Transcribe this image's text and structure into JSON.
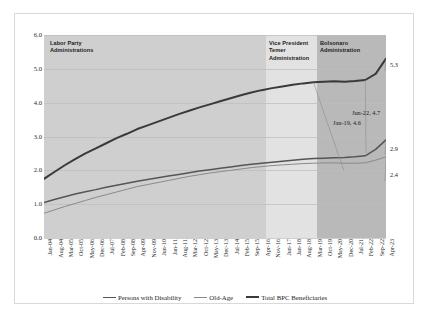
{
  "chart_data": {
    "type": "line",
    "title": "",
    "xlabel": "",
    "ylabel": "",
    "ylim": [
      0.0,
      6.0
    ],
    "ytick_labels": [
      "0.0",
      "1.0",
      "2.0",
      "3.0",
      "4.0",
      "5.0",
      "6.0"
    ],
    "ytick_values": [
      0.0,
      1.0,
      2.0,
      3.0,
      4.0,
      5.0,
      6.0
    ],
    "grid": true,
    "legend_position": "bottom",
    "categories": [
      "Jan-04",
      "Aug-04",
      "Mar-05",
      "Oct-05",
      "May-06",
      "Dec-06",
      "Jul-07",
      "Feb-08",
      "Sep-08",
      "Apr-09",
      "Nov-09",
      "Jun-10",
      "Jan-11",
      "Aug-11",
      "Mar-12",
      "Oct-12",
      "May-13",
      "Dec-13",
      "Jul-14",
      "Feb-15",
      "Sep-15",
      "Apr-16",
      "Nov-16",
      "Jun-17",
      "Jan-18",
      "Aug-18",
      "Mar-19",
      "Oct-19",
      "May-20",
      "Dec-20",
      "Jul-21",
      "Feb-22",
      "Sep-22",
      "Apr-23"
    ],
    "series": [
      {
        "name": "Total BPC Beneficiaries",
        "color": "#3a3a3a",
        "values": [
          1.75,
          1.95,
          2.15,
          2.33,
          2.5,
          2.65,
          2.8,
          2.95,
          3.08,
          3.22,
          3.33,
          3.44,
          3.55,
          3.66,
          3.76,
          3.86,
          3.95,
          4.04,
          4.13,
          4.22,
          4.3,
          4.37,
          4.43,
          4.48,
          4.53,
          4.57,
          4.6,
          4.62,
          4.63,
          4.62,
          4.64,
          4.67,
          4.85,
          5.3
        ]
      },
      {
        "name": "Persons with Disability",
        "color": "#555555",
        "values": [
          1.05,
          1.14,
          1.22,
          1.3,
          1.37,
          1.43,
          1.5,
          1.56,
          1.62,
          1.68,
          1.73,
          1.78,
          1.83,
          1.88,
          1.93,
          1.98,
          2.02,
          2.06,
          2.1,
          2.14,
          2.18,
          2.21,
          2.24,
          2.27,
          2.3,
          2.33,
          2.35,
          2.36,
          2.37,
          2.38,
          2.4,
          2.43,
          2.62,
          2.9
        ]
      },
      {
        "name": "Old-Age",
        "color": "#8a8a8a",
        "values": [
          0.73,
          0.83,
          0.93,
          1.02,
          1.11,
          1.2,
          1.28,
          1.36,
          1.44,
          1.52,
          1.58,
          1.64,
          1.7,
          1.76,
          1.82,
          1.87,
          1.92,
          1.96,
          2.0,
          2.04,
          2.08,
          2.11,
          2.14,
          2.16,
          2.18,
          2.2,
          2.21,
          2.22,
          2.22,
          2.21,
          2.21,
          2.22,
          2.3,
          2.4
        ]
      }
    ],
    "annotations": [
      {
        "text": "Jan-19, 4.6",
        "x": "Mar-19",
        "y": 4.6
      },
      {
        "text": "Jun-22, 4.7",
        "x": "Feb-22",
        "y": 4.7
      },
      {
        "text": "5.3",
        "x": "Apr-23",
        "y": 5.3
      },
      {
        "text": "2.9",
        "x": "Apr-23",
        "y": 2.9
      },
      {
        "text": "2.4",
        "x": "Apr-23",
        "y": 2.4
      }
    ],
    "shaded_regions": [
      {
        "label": "Labor Party Administrations",
        "color": "#cfcfcf"
      },
      {
        "label": "Vice President Temer Administration",
        "color": "#e2e2e2"
      },
      {
        "label": "Bolsonaro Administration",
        "color": "#b9b9b9"
      }
    ]
  },
  "bands": {
    "labor": "Labor Party\nAdministrations",
    "labor_line1": "Labor Party",
    "labor_line2": "Administrations",
    "temer_line1": "Vice President",
    "temer_line2": "Temer",
    "temer_line3": "Administration",
    "bolsonaro_line1": "Bolsonaro",
    "bolsonaro_line2": "Administration"
  },
  "annotations": {
    "jan19": "Jan-19, 4.6",
    "jun22": "Jun-22, 4.7",
    "end_total": "5.3",
    "end_disability": "2.9",
    "end_oldage": "2.4"
  },
  "legend": {
    "items": [
      {
        "label": "Persons with Disability",
        "color": "#555555",
        "width": "1.6px"
      },
      {
        "label": "Old-Age",
        "color": "#8a8a8a",
        "width": "1.1px"
      },
      {
        "label": "Total BPC Beneficiaries",
        "color": "#3a3a3a",
        "width": "2.2px"
      }
    ]
  }
}
